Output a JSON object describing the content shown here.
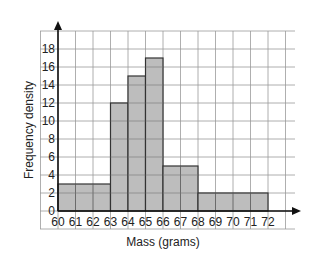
{
  "chart_data": {
    "type": "bar",
    "subtype": "histogram",
    "title": "",
    "xlabel": "Mass (grams)",
    "ylabel": "Frequency density",
    "bins": [
      {
        "from": 60,
        "to": 63,
        "value": 3
      },
      {
        "from": 63,
        "to": 64,
        "value": 12
      },
      {
        "from": 64,
        "to": 65,
        "value": 15
      },
      {
        "from": 65,
        "to": 66,
        "value": 17
      },
      {
        "from": 66,
        "to": 68,
        "value": 5
      },
      {
        "from": 68,
        "to": 72,
        "value": 2
      }
    ],
    "xticks": [
      60,
      61,
      62,
      63,
      64,
      65,
      66,
      67,
      68,
      69,
      70,
      71,
      72
    ],
    "yticks": [
      0,
      2,
      4,
      6,
      8,
      10,
      12,
      14,
      16,
      18
    ],
    "xlim": [
      60,
      72
    ],
    "ylim": [
      0,
      18
    ],
    "grid": true,
    "legend": null,
    "colors": {
      "bar": "#bdbdbd",
      "bar_edge": "#333333",
      "grid": "#9a9a9a",
      "axis": "#111111"
    }
  }
}
